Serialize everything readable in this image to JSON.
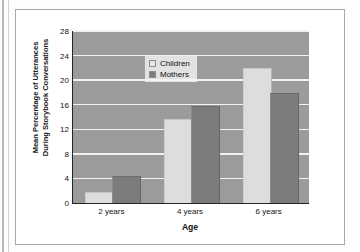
{
  "chart_data": {
    "type": "bar",
    "title": "",
    "xlabel": "Age",
    "ylabel_lines": [
      "Mean Percentage of Utterances",
      "During Storybook Conversations"
    ],
    "ylabel": "Mean Percentage of Utterances During Storybook Conversations",
    "categories": [
      "2 years",
      "4 years",
      "6 years"
    ],
    "series": [
      {
        "name": "Children",
        "values": [
          1.7,
          13.5,
          21.8
        ],
        "color": "#dddddd"
      },
      {
        "name": "Mothers",
        "values": [
          4.2,
          15.7,
          17.8
        ],
        "color": "#7c7c7c"
      }
    ],
    "ylim": [
      0,
      28
    ],
    "ytick_values": [
      0,
      4,
      8,
      12,
      16,
      20,
      24,
      28
    ],
    "ytick_labels": [
      "0",
      "4",
      "8",
      "12",
      "16",
      "20",
      "24",
      "28"
    ],
    "grid": true,
    "grid_axis": "y",
    "grid_color": "#f2f2f2",
    "plot_background": "#9b9b9b",
    "legend": {
      "position": "top-left-inside",
      "entries": [
        "Children",
        "Mothers"
      ]
    }
  }
}
